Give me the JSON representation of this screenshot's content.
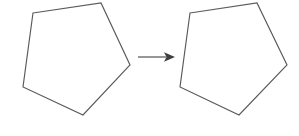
{
  "figure": {
    "background_color": "#ffffff",
    "width": 299,
    "height": 136,
    "stroke_color": "#5a5a5a",
    "arrow_color": "#3f3f3f",
    "shapes": [
      {
        "name": "left-pentagon",
        "label": "Pentagon (pre-image)",
        "sides": 5,
        "points": "33,13 101,3 130,65 83,115 23,87",
        "vertices": [
          {
            "x": 33,
            "y": 13
          },
          {
            "x": 101,
            "y": 3
          },
          {
            "x": 130,
            "y": 65
          },
          {
            "x": 83,
            "y": 115
          },
          {
            "x": 23,
            "y": 87
          }
        ]
      },
      {
        "name": "right-pentagon",
        "label": "Pentagon (image)",
        "sides": 5,
        "points": "190,13 257,3 287,65 239,115 180,87",
        "vertices": [
          {
            "x": 190,
            "y": 13
          },
          {
            "x": 257,
            "y": 3
          },
          {
            "x": 287,
            "y": 65
          },
          {
            "x": 239,
            "y": 115
          },
          {
            "x": 180,
            "y": 87
          }
        ]
      }
    ],
    "arrow": {
      "name": "transformation-arrow",
      "label": "maps to",
      "shaft_from": {
        "x": 138,
        "y": 57
      },
      "shaft_to": {
        "x": 166,
        "y": 57
      },
      "head_points": "164,52.3 175,57 164,61.7 166.5,57"
    }
  }
}
